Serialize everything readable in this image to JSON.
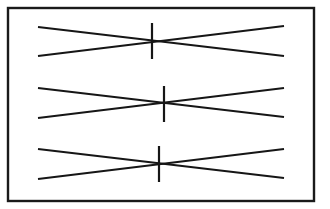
{
  "figure": {
    "canvas": {
      "width": 330,
      "height": 209
    },
    "background_color": "#ffffff",
    "ink_color": "#161616",
    "frame": {
      "name": "outer-border",
      "x": 8,
      "y": 8,
      "width": 306,
      "height": 193,
      "stroke_color": "#1a1a1a",
      "stroke_width": 2.4,
      "fill": "#ffffff"
    },
    "line_style": {
      "stroke_color": "#161616",
      "stroke_width": 2.2
    },
    "tick_style": {
      "stroke_color": "#161616",
      "stroke_width": 2.2
    },
    "groups": [
      {
        "id": "group-1",
        "label": "top crossing pair",
        "line_a": {
          "x1": 38,
          "y1": 27,
          "x2": 284,
          "y2": 56
        },
        "line_b": {
          "x1": 38,
          "y1": 56,
          "x2": 284,
          "y2": 26
        },
        "crossing": {
          "x": 152,
          "y": 41
        },
        "tick": {
          "x": 152,
          "y1": 23,
          "y2": 59
        }
      },
      {
        "id": "group-2",
        "label": "middle crossing pair",
        "line_a": {
          "x1": 38,
          "y1": 88,
          "x2": 284,
          "y2": 117
        },
        "line_b": {
          "x1": 38,
          "y1": 118,
          "x2": 284,
          "y2": 88
        },
        "crossing": {
          "x": 164,
          "y": 104
        },
        "tick": {
          "x": 164,
          "y1": 86,
          "y2": 122
        }
      },
      {
        "id": "group-3",
        "label": "bottom crossing pair",
        "line_a": {
          "x1": 38,
          "y1": 149,
          "x2": 284,
          "y2": 178
        },
        "line_b": {
          "x1": 38,
          "y1": 179,
          "x2": 284,
          "y2": 149
        },
        "crossing": {
          "x": 159,
          "y": 165
        },
        "tick": {
          "x": 159,
          "y1": 146,
          "y2": 182
        }
      }
    ]
  }
}
